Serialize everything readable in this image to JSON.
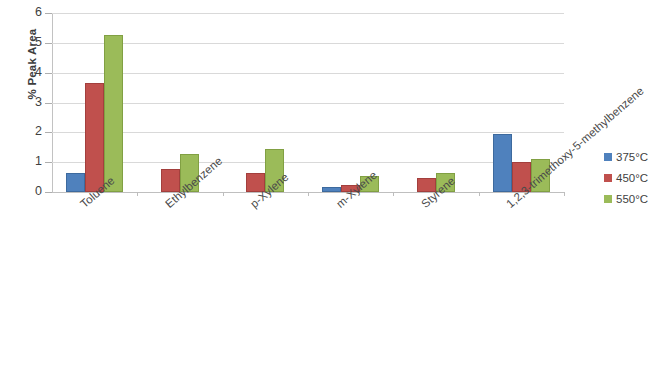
{
  "chart_data": {
    "type": "bar",
    "title": "",
    "xlabel": "",
    "ylabel": "% Peak Area",
    "ylim": [
      0,
      6
    ],
    "ytick_labels": [
      "6",
      "5",
      "4",
      "3",
      "2",
      "1",
      "0"
    ],
    "yticks": [
      6,
      5,
      4,
      3,
      2,
      1,
      0
    ],
    "grid": true,
    "legend_position": "right",
    "categories": [
      "Toluene",
      "Ethylbenzene",
      "p-Xylene",
      "m-Xylene",
      "Styrene",
      "1,2,3-trimethoxy-5-methylbenzene"
    ],
    "series": [
      {
        "name": "375°C",
        "color": "#4F81BD",
        "values": [
          0.65,
          0,
          0,
          0.17,
          0,
          1.95
        ]
      },
      {
        "name": "450°C",
        "color": "#C0504D",
        "values": [
          3.65,
          0.78,
          0.65,
          0.25,
          0.48,
          1.02
        ]
      },
      {
        "name": "550°C",
        "color": "#9BBB59",
        "values": [
          5.25,
          1.27,
          1.45,
          0.55,
          0.65,
          1.12
        ]
      }
    ]
  },
  "legend": {
    "items": [
      {
        "label": "375°C",
        "color": "#4F81BD"
      },
      {
        "label": "450°C",
        "color": "#C0504D"
      },
      {
        "label": "550°C",
        "color": "#9BBB59"
      }
    ]
  }
}
